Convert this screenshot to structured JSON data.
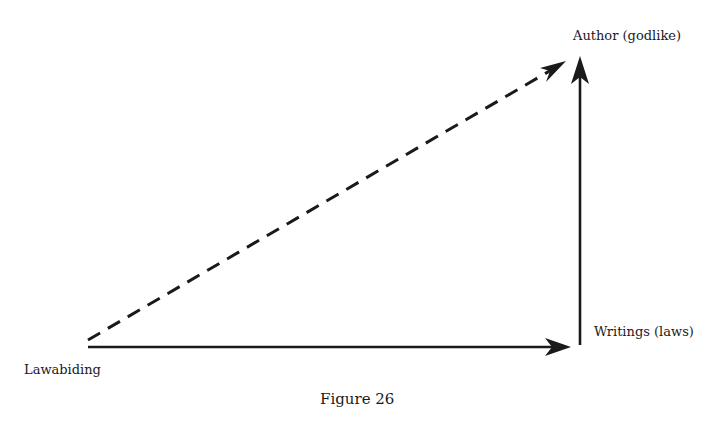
{
  "figure": {
    "caption": "Figure 26",
    "nodes": {
      "origin": {
        "label": "Lawabiding"
      },
      "right": {
        "label": "Writings (laws)"
      },
      "top": {
        "label": "Author (godlike)"
      }
    },
    "edges": [
      {
        "from": "Lawabiding",
        "to": "Writings (laws)",
        "style": "solid"
      },
      {
        "from": "Writings (laws)",
        "to": "Author (godlike)",
        "style": "solid"
      },
      {
        "from": "Lawabiding",
        "to": "Author (godlike)",
        "style": "dashed"
      }
    ],
    "colors": {
      "stroke": "#1a1a1a",
      "background": "#ffffff"
    }
  }
}
